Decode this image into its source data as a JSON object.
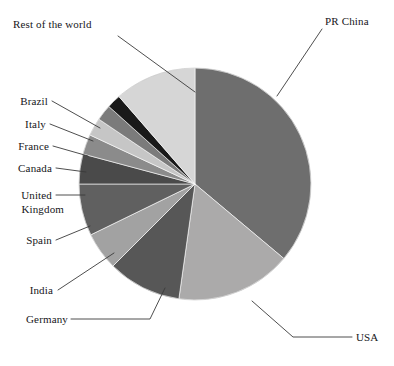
{
  "chart_data": {
    "type": "pie",
    "title": "",
    "subtitle": "",
    "xlabel": "",
    "ylabel": "",
    "legend_position": "none",
    "grid": false,
    "labels_as_callouts": true,
    "categories": [
      "PR China",
      "USA",
      "Germany",
      "India",
      "Spain",
      "United Kingdom",
      "Canada",
      "France",
      "Italy",
      "Brazil",
      "Rest of the world"
    ],
    "values": [
      36.1,
      16.1,
      10.3,
      5.3,
      7.2,
      4.2,
      2.8,
      2.5,
      2.2,
      1.9,
      11.4
    ],
    "units": "percent",
    "start_angle_deg": 0,
    "direction": "clockwise",
    "slices": [
      {
        "label": "PR China",
        "value": 36.1,
        "angle_deg": 130.0,
        "color": "#6e6e6e"
      },
      {
        "label": "USA",
        "value": 16.1,
        "angle_deg": 58.0,
        "color": "#abaaaa"
      },
      {
        "label": "Germany",
        "value": 10.3,
        "angle_deg": 37.0,
        "color": "#575757"
      },
      {
        "label": "India",
        "value": 5.3,
        "angle_deg": 19.0,
        "color": "#a2a2a2"
      },
      {
        "label": "Spain",
        "value": 7.2,
        "angle_deg": 26.0,
        "color": "#606060"
      },
      {
        "label": "United Kingdom",
        "value": 4.2,
        "angle_deg": 15.0,
        "color": "#4a4a4a"
      },
      {
        "label": "Canada",
        "value": 2.8,
        "angle_deg": 10.0,
        "color": "#8b8b8b"
      },
      {
        "label": "France",
        "value": 2.5,
        "angle_deg": 9.0,
        "color": "#c6c6c6"
      },
      {
        "label": "Italy",
        "value": 2.2,
        "angle_deg": 8.0,
        "color": "#7b7b7b"
      },
      {
        "label": "Brazil",
        "value": 1.9,
        "angle_deg": 7.0,
        "color": "#191919"
      },
      {
        "label": "Rest of the world",
        "value": 11.4,
        "angle_deg": 41.0,
        "color": "#d6d6d6"
      }
    ]
  },
  "labels": {
    "pr_china": "PR China",
    "usa": "USA",
    "germany": "Germany",
    "india": "India",
    "spain": "Spain",
    "united_kingdom_line1": "United",
    "united_kingdom_line2": "Kingdom",
    "canada": "Canada",
    "france": "France",
    "italy": "Italy",
    "brazil": "Brazil",
    "rest_of_the_world": "Rest of the world"
  },
  "colors": {
    "background": "#ffffff",
    "leader_line": "#3a3a3a",
    "text": "#16161a"
  }
}
